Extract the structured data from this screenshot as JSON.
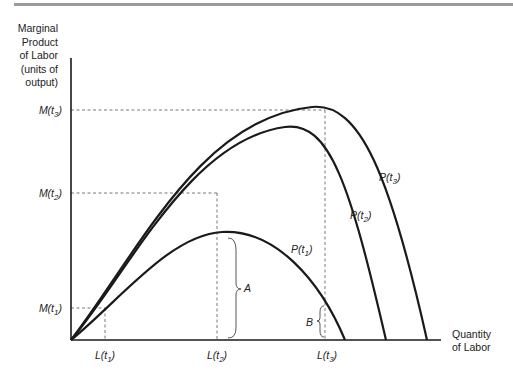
{
  "diagram": {
    "y_axis_label": [
      "Marginal",
      "Product",
      "of Labor",
      "(units of",
      "output)"
    ],
    "x_axis_label": [
      "Quantity",
      "of Labor"
    ],
    "y_ticks": [
      {
        "base": "M(t",
        "sub": "3",
        "close": ")"
      },
      {
        "base": "M(t",
        "sub": "2",
        "close": ")"
      },
      {
        "base": "M(t",
        "sub": "1",
        "close": ")"
      }
    ],
    "x_ticks": [
      {
        "base": "L(t",
        "sub": "1",
        "close": ")"
      },
      {
        "base": "L(t",
        "sub": "2",
        "close": ")"
      },
      {
        "base": "L(t",
        "sub": "3",
        "close": ")"
      }
    ],
    "curves": [
      {
        "base": "P(t",
        "sub": "1",
        "close": ")"
      },
      {
        "base": "P(t",
        "sub": "2",
        "close": ")"
      },
      {
        "base": "P(t",
        "sub": "3",
        "close": ")"
      }
    ],
    "braces": {
      "a": "A",
      "b": "B"
    },
    "colors": {
      "line": "#1a1a1a",
      "dashed": "#555555",
      "topbar": "#9a9a9a"
    }
  }
}
